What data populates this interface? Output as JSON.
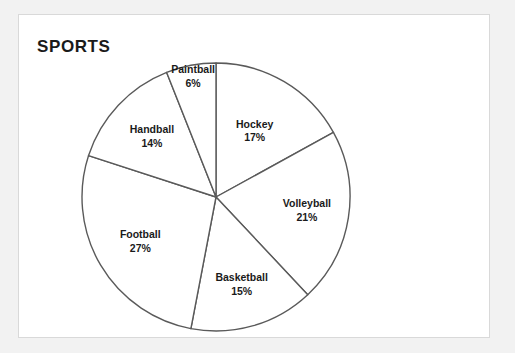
{
  "card": {
    "title": "SPORTS"
  },
  "chart_data": {
    "type": "pie",
    "title": "SPORTS",
    "categories": [
      "Hockey",
      "Volleyball",
      "Basketball",
      "Football",
      "Handball",
      "Paintball"
    ],
    "values": [
      17,
      21,
      15,
      27,
      14,
      6
    ],
    "value_suffix": "%",
    "labels": [
      "17%",
      "21%",
      "15%",
      "27%",
      "14%",
      "6%"
    ],
    "start_angle_deg": 0,
    "direction": "clockwise",
    "legend": "none",
    "slice_fill": "#ffffff",
    "slice_stroke": "#5a5a5a",
    "total": 100,
    "xlabel": "",
    "ylabel": ""
  },
  "slices": {
    "hockey": {
      "name": "Hockey",
      "pct": "17%"
    },
    "volleyball": {
      "name": "Volleyball",
      "pct": "21%"
    },
    "basketball": {
      "name": "Basketball",
      "pct": "15%"
    },
    "football": {
      "name": "Football",
      "pct": "27%"
    },
    "handball": {
      "name": "Handball",
      "pct": "14%"
    },
    "paintball": {
      "name": "Paintball",
      "pct": "6%"
    }
  }
}
